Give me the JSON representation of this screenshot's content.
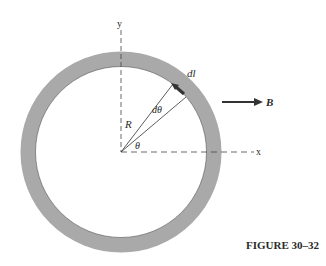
{
  "figure": {
    "caption": "FIGURE 30–32",
    "labels": {
      "y_axis": "y",
      "x_axis": "x",
      "radius": "R",
      "d_theta": "dθ",
      "theta": "θ",
      "dl": "dl",
      "field": "B"
    },
    "colors": {
      "ring": "#a9a9a9",
      "ink": "#2a2a2a",
      "background": "#ffffff"
    },
    "geometry": {
      "center": [
        121,
        152
      ],
      "outer_radius": 100,
      "inner_radius": 86
    }
  }
}
